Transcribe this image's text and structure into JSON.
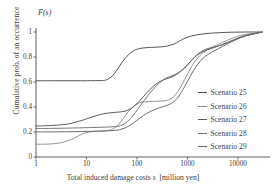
{
  "chart_data": {
    "type": "line",
    "title": "",
    "ylabel": "Cumulative prob. of an occurrence",
    "xlabel": "Total induced damage costs  s  [million yen]",
    "xlabel_plain": "Total induced damage costs",
    "xlabel_symbol": "s",
    "xlabel_units": "[million yen]",
    "yaxis_corner_label": "F(s)",
    "xscale": "log",
    "xlim": [
      1,
      30000
    ],
    "ylim": [
      0,
      1
    ],
    "xticks": [
      1,
      10,
      100,
      1000,
      10000
    ],
    "xtick_labels": [
      "1",
      "10",
      "100",
      "1000",
      "10000"
    ],
    "yticks": [
      0,
      0.2,
      0.4,
      0.6,
      0.8,
      1
    ],
    "ytick_labels": [
      "0",
      "0.2",
      "0.4",
      "0.6",
      "0.8",
      "1"
    ],
    "grid": false,
    "legend_position": "right",
    "series": [
      {
        "name": "Scenario 25",
        "color": "#4a4a4a",
        "x": [
          1,
          3,
          10,
          20,
          25,
          32,
          40,
          50,
          63,
          80,
          100,
          130,
          170,
          220,
          300,
          400,
          550,
          700,
          900,
          1200,
          1600,
          2200,
          3000,
          4500,
          7000,
          10000,
          16000,
          30000
        ],
        "y": [
          0.61,
          0.61,
          0.61,
          0.612,
          0.618,
          0.645,
          0.695,
          0.755,
          0.805,
          0.842,
          0.862,
          0.872,
          0.876,
          0.878,
          0.881,
          0.888,
          0.905,
          0.928,
          0.951,
          0.968,
          0.979,
          0.986,
          0.991,
          0.995,
          0.998,
          0.999,
          1.0,
          1.0
        ]
      },
      {
        "name": "Scenario 26",
        "color": "#8d8d8d",
        "x": [
          1,
          1.6,
          2.5,
          4,
          6,
          8,
          10,
          14,
          20,
          26,
          34,
          45,
          60,
          80,
          110,
          150,
          200,
          280,
          380,
          520,
          700,
          950,
          1300,
          1800,
          2500,
          3500,
          5000,
          8000,
          13000,
          30000
        ],
        "y": [
          0.102,
          0.103,
          0.108,
          0.125,
          0.155,
          0.182,
          0.196,
          0.205,
          0.208,
          0.212,
          0.225,
          0.268,
          0.335,
          0.395,
          0.432,
          0.442,
          0.445,
          0.447,
          0.452,
          0.478,
          0.545,
          0.645,
          0.745,
          0.815,
          0.858,
          0.888,
          0.918,
          0.952,
          0.978,
          0.999
        ]
      },
      {
        "name": "Scenario 27",
        "color": "#555555",
        "x": [
          1,
          2,
          4,
          7,
          10,
          14,
          20,
          27,
          36,
          48,
          64,
          85,
          115,
          155,
          210,
          280,
          380,
          520,
          700,
          950,
          1300,
          1800,
          2500,
          3500,
          5000,
          8000,
          13000,
          30000
        ],
        "y": [
          0.248,
          0.252,
          0.262,
          0.285,
          0.305,
          0.325,
          0.342,
          0.352,
          0.357,
          0.361,
          0.372,
          0.402,
          0.452,
          0.512,
          0.565,
          0.602,
          0.625,
          0.645,
          0.678,
          0.728,
          0.788,
          0.832,
          0.858,
          0.878,
          0.902,
          0.935,
          0.968,
          0.999
        ]
      },
      {
        "name": "Scenario 28",
        "color": "#707070",
        "x": [
          1,
          2,
          4,
          7,
          11,
          16,
          23,
          32,
          44,
          60,
          80,
          108,
          145,
          195,
          265,
          355,
          480,
          650,
          880,
          1200,
          1650,
          2300,
          3200,
          4500,
          6500,
          10000,
          16000,
          30000
        ],
        "y": [
          0.228,
          0.229,
          0.231,
          0.233,
          0.235,
          0.237,
          0.239,
          0.241,
          0.248,
          0.272,
          0.322,
          0.392,
          0.462,
          0.528,
          0.585,
          0.625,
          0.648,
          0.672,
          0.712,
          0.772,
          0.828,
          0.862,
          0.878,
          0.892,
          0.915,
          0.945,
          0.975,
          1.0
        ]
      },
      {
        "name": "Scenario 29",
        "color": "#666666",
        "x": [
          1,
          2,
          4,
          8,
          14,
          22,
          32,
          45,
          62,
          85,
          115,
          155,
          210,
          285,
          385,
          520,
          700,
          950,
          1300,
          1800,
          2500,
          3500,
          5000,
          8000,
          13000,
          30000
        ],
        "y": [
          0.201,
          0.201,
          0.202,
          0.204,
          0.206,
          0.208,
          0.211,
          0.218,
          0.238,
          0.272,
          0.312,
          0.348,
          0.375,
          0.395,
          0.412,
          0.438,
          0.495,
          0.588,
          0.688,
          0.768,
          0.818,
          0.852,
          0.885,
          0.928,
          0.965,
          0.998
        ]
      }
    ]
  },
  "legend": {
    "entries": [
      {
        "label": "Scenario 25"
      },
      {
        "label": "Scenario 26"
      },
      {
        "label": "Scenario 27"
      },
      {
        "label": "Scenario 28"
      },
      {
        "label": "Scenario 29"
      }
    ]
  },
  "axes": {
    "y_axis_title": "Cumulative prob. of an occurrence",
    "f_label": "F(s)",
    "x_title_main": "Total induced damage costs",
    "x_title_var": "s",
    "x_title_unit": "[million yen]"
  }
}
